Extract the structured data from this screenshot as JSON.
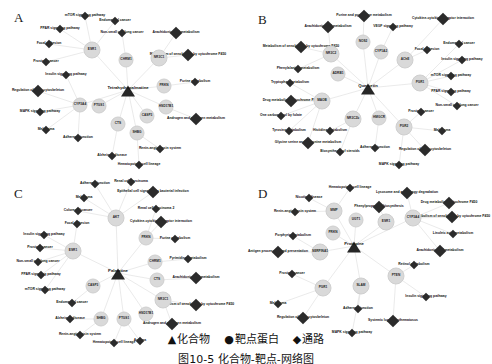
{
  "figure": {
    "caption": "图10-5  化合物-靶点-网络图",
    "legend": {
      "items": [
        {
          "symbol": "▲",
          "label": "化合物"
        },
        {
          "symbol": "●",
          "label": "靶点蛋白"
        },
        {
          "symbol": "◆",
          "label": "通路"
        }
      ]
    },
    "colors": {
      "background": "#ffffff",
      "compound_node": "#262626",
      "target_node": "#d9d9d9",
      "pathway_node": "#2b2b2b",
      "edge": "#dcdcdc",
      "text": "#111111"
    }
  },
  "panels": [
    {
      "id": "panel-a",
      "letter": "A",
      "compound": {
        "label": "Tetrahydropalmatine",
        "x": 128,
        "y": 88
      },
      "targets": [
        {
          "label": "ESR1",
          "x": 92,
          "y": 48,
          "big": true
        },
        {
          "label": "NR3C1",
          "x": 159,
          "y": 56,
          "big": true
        },
        {
          "label": "CYP3A4",
          "x": 80,
          "y": 103,
          "big": false
        },
        {
          "label": "PTGS1",
          "x": 99,
          "y": 104,
          "big": false
        },
        {
          "label": "HSD17B1",
          "x": 166,
          "y": 105,
          "big": false
        },
        {
          "label": "SHBG",
          "x": 137,
          "y": 131,
          "big": false
        },
        {
          "label": "CHRM1",
          "x": 126,
          "y": 58,
          "big": false
        },
        {
          "label": "PRKN",
          "x": 164,
          "y": 84,
          "big": false
        },
        {
          "label": "CTS",
          "x": 118,
          "y": 122,
          "big": false
        },
        {
          "label": "CASP3",
          "x": 147,
          "y": 114,
          "big": false
        }
      ],
      "pathways": [
        {
          "label": "mTOR signaling pathway",
          "x": 85,
          "y": 14
        },
        {
          "label": "PPAR signaling pathway",
          "x": 60,
          "y": 27
        },
        {
          "label": "Focal adhesion",
          "x": 49,
          "y": 42
        },
        {
          "label": "Prostate cancer",
          "x": 46,
          "y": 60
        },
        {
          "label": "Insulin signaling pathway",
          "x": 66,
          "y": 73
        },
        {
          "label": "Regulation of actin cytoskeleton",
          "x": 38,
          "y": 89
        },
        {
          "label": "MAPK signaling pathway",
          "x": 40,
          "y": 110
        },
        {
          "label": "Melanoma",
          "x": 46,
          "y": 128
        },
        {
          "label": "Adherens junction",
          "x": 78,
          "y": 136
        },
        {
          "label": "Alzheimer disease",
          "x": 112,
          "y": 154
        },
        {
          "label": "Hematopoietic cell lineage",
          "x": 139,
          "y": 163
        },
        {
          "label": "Renin-angiotensin system",
          "x": 160,
          "y": 147
        },
        {
          "label": "Androgen and estrogen metabolism",
          "x": 196,
          "y": 117
        },
        {
          "label": "Purine metabolism",
          "x": 195,
          "y": 80
        },
        {
          "label": "Metabolism of xenobiotics by cytochrome P450",
          "x": 188,
          "y": 53
        },
        {
          "label": "Arachidonic acid metabolism",
          "x": 176,
          "y": 31
        },
        {
          "label": "Non-small cell lung cancer",
          "x": 122,
          "y": 31
        },
        {
          "label": "Endometrial cancer",
          "x": 115,
          "y": 19
        }
      ]
    },
    {
      "id": "panel-b",
      "letter": "B",
      "compound": {
        "label": "Quercetin",
        "x": 122,
        "y": 86
      },
      "targets": [
        {
          "label": "NOS2",
          "x": 117,
          "y": 40,
          "big": false
        },
        {
          "label": "CYP1A2",
          "x": 135,
          "y": 50,
          "big": false
        },
        {
          "label": "AChE",
          "x": 159,
          "y": 58,
          "big": true
        },
        {
          "label": "NR3C2",
          "x": 85,
          "y": 52,
          "big": true
        },
        {
          "label": "ADRB1",
          "x": 92,
          "y": 72,
          "big": false
        },
        {
          "label": "MAOB",
          "x": 76,
          "y": 99,
          "big": true
        },
        {
          "label": "NR3C2b",
          "x": 107,
          "y": 117,
          "big": true
        },
        {
          "label": "HMGCR",
          "x": 133,
          "y": 116,
          "big": false
        },
        {
          "label": "PGR1",
          "x": 174,
          "y": 81,
          "big": true
        },
        {
          "label": "PGR2",
          "x": 158,
          "y": 125,
          "big": true
        }
      ],
      "pathways": [
        {
          "label": "Purine and pyrimidine metabolism",
          "x": 118,
          "y": 14
        },
        {
          "label": "Arachidonic acid metabolism",
          "x": 82,
          "y": 25
        },
        {
          "label": "VEGF signaling pathway",
          "x": 147,
          "y": 25
        },
        {
          "label": "Cytokine-cytokine receptor interaction",
          "x": 197,
          "y": 17
        },
        {
          "label": "Focal adhesion",
          "x": 181,
          "y": 48
        },
        {
          "label": "Endometrial cancer",
          "x": 213,
          "y": 42
        },
        {
          "label": "Insulin signaling pathway",
          "x": 216,
          "y": 58
        },
        {
          "label": "mTOR signaling pathway",
          "x": 205,
          "y": 74
        },
        {
          "label": "PPAR signaling pathway",
          "x": 205,
          "y": 90
        },
        {
          "label": "Non-small cell lung cancer",
          "x": 211,
          "y": 104
        },
        {
          "label": "Prostate cancer",
          "x": 175,
          "y": 110
        },
        {
          "label": "Melanoma",
          "x": 196,
          "y": 129
        },
        {
          "label": "Regulation of actin cytoskeleton",
          "x": 179,
          "y": 148
        },
        {
          "label": "MAPK signaling pathway",
          "x": 153,
          "y": 163
        },
        {
          "label": "Adherens junction",
          "x": 129,
          "y": 146
        },
        {
          "label": "Biosynthesis of steroids",
          "x": 94,
          "y": 150
        },
        {
          "label": "Glycine serine and threonine metabolism",
          "x": 62,
          "y": 141
        },
        {
          "label": "Tyrosine metabolism",
          "x": 43,
          "y": 129
        },
        {
          "label": "Histidine metabolism",
          "x": 84,
          "y": 129
        },
        {
          "label": "One carbon pool by folate",
          "x": 35,
          "y": 114
        },
        {
          "label": "Drug metabolism cytochrome P450",
          "x": 45,
          "y": 99
        },
        {
          "label": "Tryptophan metabolism",
          "x": 44,
          "y": 81
        },
        {
          "label": "Phenylalanine metabolism",
          "x": 52,
          "y": 67
        },
        {
          "label": "Metabolism of xenobiotics by cytochrome P450",
          "x": 55,
          "y": 45
        }
      ]
    },
    {
      "id": "panel-c",
      "letter": "C",
      "compound": {
        "label": "Palmatine",
        "x": 118,
        "y": 95
      },
      "targets": [
        {
          "label": "AKT",
          "x": 116,
          "y": 40,
          "big": true
        },
        {
          "label": "PRKN",
          "x": 146,
          "y": 60,
          "big": false
        },
        {
          "label": "ESR1",
          "x": 73,
          "y": 73,
          "big": true
        },
        {
          "label": "CASP3",
          "x": 93,
          "y": 108,
          "big": false
        },
        {
          "label": "CTS",
          "x": 157,
          "y": 102,
          "big": false
        },
        {
          "label": "NR3C1",
          "x": 163,
          "y": 122,
          "big": true
        },
        {
          "label": "HSD17B1",
          "x": 146,
          "y": 136,
          "big": false
        },
        {
          "label": "SHBG",
          "x": 101,
          "y": 141,
          "big": false
        },
        {
          "label": "PTGS1",
          "x": 124,
          "y": 141,
          "big": false
        },
        {
          "label": "CHRM1",
          "x": 155,
          "y": 84,
          "big": false
        }
      ],
      "pathways": [
        {
          "label": "Adherens junction",
          "x": 95,
          "y": 6
        },
        {
          "label": "Renal cell carcinoma",
          "x": 131,
          "y": 4
        },
        {
          "label": "Epithelial cell signaling in bacterial infection",
          "x": 153,
          "y": 14
        },
        {
          "label": "Melanoma",
          "x": 84,
          "y": 20
        },
        {
          "label": "Renal cell carcinoma 2",
          "x": 156,
          "y": 31
        },
        {
          "label": "Colorectal cancer",
          "x": 78,
          "y": 33
        },
        {
          "label": "Cytokine-cytokine receptor interaction",
          "x": 161,
          "y": 44
        },
        {
          "label": "Focal adhesion",
          "x": 77,
          "y": 46
        },
        {
          "label": "Insulin signaling pathway",
          "x": 44,
          "y": 57
        },
        {
          "label": "Purine metabolism",
          "x": 175,
          "y": 61
        },
        {
          "label": "Prostate cancer",
          "x": 40,
          "y": 70
        },
        {
          "label": "Non-small cell lung cancer",
          "x": 38,
          "y": 84
        },
        {
          "label": "Pyrimidine metabolism",
          "x": 188,
          "y": 81
        },
        {
          "label": "PPAR signaling pathway",
          "x": 41,
          "y": 97
        },
        {
          "label": "mTOR signaling pathway",
          "x": 45,
          "y": 112
        },
        {
          "label": "Arachidonic acid metabolism",
          "x": 196,
          "y": 100
        },
        {
          "label": "Endometrial cancer",
          "x": 72,
          "y": 125
        },
        {
          "label": "Metabolism of xenobiotics by cytochrome P450",
          "x": 196,
          "y": 127
        },
        {
          "label": "Alzheimer disease",
          "x": 70,
          "y": 141
        },
        {
          "label": "Androgen and estrogen metabolism",
          "x": 172,
          "y": 146
        },
        {
          "label": "Renin-angiotensin system",
          "x": 80,
          "y": 157
        },
        {
          "label": "Hematopoietic cell lineage",
          "x": 114,
          "y": 165
        },
        {
          "label": "Asthma",
          "x": 140,
          "y": 163
        }
      ]
    },
    {
      "id": "panel-d",
      "letter": "D",
      "compound": {
        "label": "Protopine",
        "x": 108,
        "y": 68
      },
      "targets": [
        {
          "label": "MMP",
          "x": 88,
          "y": 33,
          "big": true
        },
        {
          "label": "UGT1",
          "x": 110,
          "y": 42,
          "big": false
        },
        {
          "label": "ESR1",
          "x": 140,
          "y": 44,
          "big": true
        },
        {
          "label": "CYP3A4",
          "x": 167,
          "y": 40,
          "big": true
        },
        {
          "label": "PRKN",
          "x": 87,
          "y": 55,
          "big": false
        },
        {
          "label": "SERPINA1",
          "x": 74,
          "y": 74,
          "big": true
        },
        {
          "label": "PGR1",
          "x": 77,
          "y": 110,
          "big": true
        },
        {
          "label": "SLAM",
          "x": 115,
          "y": 108,
          "big": true
        },
        {
          "label": "PTEN",
          "x": 150,
          "y": 98,
          "big": true
        }
      ],
      "pathways": [
        {
          "label": "Hematopoietic cell lineage",
          "x": 104,
          "y": 10
        },
        {
          "label": "Nicotine disease",
          "x": 63,
          "y": 20
        },
        {
          "label": "Lysosome and autophagy degradation",
          "x": 161,
          "y": 15
        },
        {
          "label": "Drug metabolism cytochrome P450",
          "x": 203,
          "y": 25
        },
        {
          "label": "Renin-angiotensin system",
          "x": 49,
          "y": 34
        },
        {
          "label": "Phenylpropanoid biosynthesis",
          "x": 133,
          "y": 29
        },
        {
          "label": "Metabolism of xenobiotics by cytochrome P450",
          "x": 206,
          "y": 39
        },
        {
          "label": "Porphyrin metabolism",
          "x": 47,
          "y": 58
        },
        {
          "label": "Linoleic acid metabolism",
          "x": 207,
          "y": 56
        },
        {
          "label": "Antigen processing and presentation",
          "x": 32,
          "y": 74
        },
        {
          "label": "Arachidonic acid metabolism",
          "x": 194,
          "y": 73
        },
        {
          "label": "Prostate cancer",
          "x": 46,
          "y": 96
        },
        {
          "label": "Retinol metabolism",
          "x": 168,
          "y": 87
        },
        {
          "label": "Melanoma",
          "x": 32,
          "y": 126
        },
        {
          "label": "Insulin signaling pathway",
          "x": 180,
          "y": 119
        },
        {
          "label": "Regulation of actin cytoskeleton",
          "x": 57,
          "y": 140
        },
        {
          "label": "Adherens junction",
          "x": 112,
          "y": 131
        },
        {
          "label": "Systemic lupus erythematosus",
          "x": 147,
          "y": 143
        },
        {
          "label": "MAPK signaling pathway",
          "x": 106,
          "y": 155
        }
      ]
    }
  ]
}
